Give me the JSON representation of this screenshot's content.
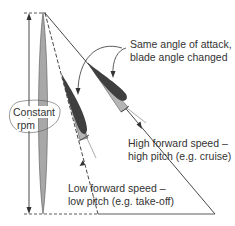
{
  "diagram": {
    "labels": {
      "constant_rpm_line1": "Constant",
      "constant_rpm_line2": "rpm",
      "same_aoa_line1": "Same angle of attack,",
      "same_aoa_line2": "blade angle changed",
      "high_speed_line1": "High forward speed –",
      "high_speed_line2": "high pitch (e.g. cruise)",
      "low_speed_line1": "Low forward speed –",
      "low_speed_line2": "low pitch (e.g. take-off)"
    },
    "colors": {
      "blade_fill": "#a8a8a8",
      "airfoil_dark": "#3f3f3f",
      "airfoil_light": "#b5b5b5",
      "line": "#333333"
    }
  }
}
